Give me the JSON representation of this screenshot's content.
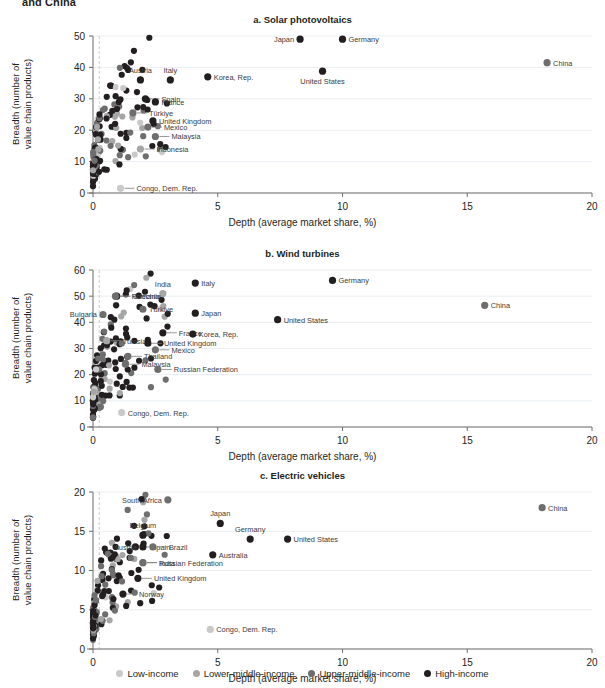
{
  "figure": {
    "cut_off_heading": "and China",
    "xlabel": "Depth (average market share, %)",
    "ylabel_line1": "Breadth (number of",
    "ylabel_line2": "value chain products)"
  },
  "legend": {
    "position": "bottom-center",
    "items": [
      {
        "label": "Low-income",
        "color": "#c9c9c9"
      },
      {
        "label": "Lower-middle-income",
        "color": "#a6a6a6"
      },
      {
        "label": "Upper-middle-income",
        "color": "#6e6e6e"
      },
      {
        "label": "High-income",
        "color": "#231f20"
      }
    ]
  },
  "chart_data": [
    {
      "type": "scatter",
      "id": "a",
      "title": "a. Solar photovoltaics",
      "xlabel": "Depth (average market share, %)",
      "ylabel": "Breadth (number of value chain products)",
      "xlim": [
        0,
        20
      ],
      "ylim": [
        0,
        50
      ],
      "xticks": [
        0,
        5,
        10,
        15,
        20
      ],
      "yticks": [
        0,
        10,
        20,
        30,
        40,
        50
      ],
      "grid": "horizontal-faint",
      "labeled_points": [
        {
          "name": "Japan",
          "x": 8.3,
          "y": 49,
          "group": "High-income",
          "label_pos": "left"
        },
        {
          "name": "Germany",
          "x": 10.0,
          "y": 49,
          "group": "High-income",
          "label_pos": "right"
        },
        {
          "name": "China",
          "x": 18.2,
          "y": 41.5,
          "group": "Upper-middle-income",
          "label_pos": "right"
        },
        {
          "name": "United States",
          "x": 9.2,
          "y": 38.8,
          "group": "High-income",
          "label_pos": "below"
        },
        {
          "name": "Korea, Rep.",
          "x": 4.6,
          "y": 37,
          "group": "High-income",
          "label_pos": "right"
        },
        {
          "name": "Austria",
          "x": 1.9,
          "y": 36,
          "group": "High-income",
          "label_pos": "above"
        },
        {
          "name": "Italy",
          "x": 3.1,
          "y": 36,
          "group": "High-income",
          "label_pos": "above"
        },
        {
          "name": "Spain",
          "x": 2.1,
          "y": 30,
          "group": "High-income",
          "label_pos": "leader"
        },
        {
          "name": "France",
          "x": 2.5,
          "y": 29,
          "group": "High-income",
          "label_pos": "right"
        },
        {
          "name": "Türkiye",
          "x": 1.6,
          "y": 25.5,
          "group": "Upper-middle-income",
          "label_pos": "leader"
        },
        {
          "name": "United Kingdom",
          "x": 2.4,
          "y": 23,
          "group": "High-income",
          "label_pos": "right"
        },
        {
          "name": "Mexico",
          "x": 2.2,
          "y": 21,
          "group": "Upper-middle-income",
          "label_pos": "leader"
        },
        {
          "name": "Malaysia",
          "x": 2.5,
          "y": 18,
          "group": "Upper-middle-income",
          "label_pos": "leader"
        },
        {
          "name": "Indonesia",
          "x": 1.9,
          "y": 14,
          "group": "Lower-middle-income",
          "label_pos": "leader"
        },
        {
          "name": "Congo, Dem. Rep.",
          "x": 1.1,
          "y": 1.5,
          "group": "Low-income",
          "label_pos": "leader"
        }
      ]
    },
    {
      "type": "scatter",
      "id": "b",
      "title": "b. Wind turbines",
      "xlabel": "Depth (average market share, %)",
      "ylabel": "Breadth (number of value chain products)",
      "xlim": [
        0,
        20
      ],
      "ylim": [
        0,
        60
      ],
      "xticks": [
        0,
        5,
        10,
        15,
        20
      ],
      "yticks": [
        0,
        10,
        20,
        30,
        40,
        50,
        60
      ],
      "grid": "horizontal-faint",
      "labeled_points": [
        {
          "name": "Germany",
          "x": 9.6,
          "y": 56,
          "group": "High-income",
          "label_pos": "right"
        },
        {
          "name": "Italy",
          "x": 4.1,
          "y": 55,
          "group": "High-income",
          "label_pos": "right"
        },
        {
          "name": "India",
          "x": 2.8,
          "y": 51,
          "group": "Lower-middle-income",
          "label_pos": "above"
        },
        {
          "name": "Czechia",
          "x": 0.95,
          "y": 50,
          "group": "High-income",
          "label_pos": "leader"
        },
        {
          "name": "China",
          "x": 15.7,
          "y": 46.5,
          "group": "Upper-middle-income",
          "label_pos": "right"
        },
        {
          "name": "Türkiye",
          "x": 2.0,
          "y": 45,
          "group": "Upper-middle-income",
          "label_pos": "right"
        },
        {
          "name": "Japan",
          "x": 4.1,
          "y": 43.5,
          "group": "High-income",
          "label_pos": "right"
        },
        {
          "name": "Bulgaria",
          "x": 0.4,
          "y": 43,
          "group": "Upper-middle-income",
          "label_pos": "left"
        },
        {
          "name": "Romania",
          "x": 0.9,
          "y": 50,
          "group": "Upper-middle-income",
          "label_pos": "leader"
        },
        {
          "name": "United States",
          "x": 7.4,
          "y": 41,
          "group": "High-income",
          "label_pos": "right"
        },
        {
          "name": "France",
          "x": 2.8,
          "y": 36,
          "group": "High-income",
          "label_pos": "leader"
        },
        {
          "name": "Korea, Rep.",
          "x": 4.0,
          "y": 35.5,
          "group": "High-income",
          "label_pos": "right"
        },
        {
          "name": "Tunisia",
          "x": 0.55,
          "y": 33,
          "group": "Lower-middle-income",
          "label_pos": "leader"
        },
        {
          "name": "United Kingdom",
          "x": 2.2,
          "y": 32,
          "group": "High-income",
          "label_pos": "leader"
        },
        {
          "name": "Mexico",
          "x": 2.5,
          "y": 29.5,
          "group": "Upper-middle-income",
          "label_pos": "leader"
        },
        {
          "name": "Thailand",
          "x": 1.4,
          "y": 27,
          "group": "Upper-middle-income",
          "label_pos": "leader"
        },
        {
          "name": "Malaysia",
          "x": 1.3,
          "y": 24,
          "group": "Upper-middle-income",
          "label_pos": "leader"
        },
        {
          "name": "Russian Federation",
          "x": 2.6,
          "y": 22,
          "group": "Upper-middle-income",
          "label_pos": "leader"
        },
        {
          "name": "Congo, Dem. Rep.",
          "x": 1.15,
          "y": 5.5,
          "group": "Low-income",
          "label_pos": "right"
        }
      ]
    },
    {
      "type": "scatter",
      "id": "c",
      "title": "c. Electric vehicles",
      "xlabel": "Depth (average market share, %)",
      "ylabel": "Breadth (number of value chain products)",
      "xlim": [
        0,
        20
      ],
      "ylim": [
        0,
        20
      ],
      "xticks": [
        0,
        5,
        10,
        15,
        20
      ],
      "yticks": [
        0,
        5,
        10,
        15,
        20
      ],
      "grid": "horizontal-faint",
      "labeled_points": [
        {
          "name": "South Africa",
          "x": 3.0,
          "y": 19,
          "group": "Upper-middle-income",
          "label_pos": "left"
        },
        {
          "name": "China",
          "x": 18.0,
          "y": 18,
          "group": "Upper-middle-income",
          "label_pos": "right"
        },
        {
          "name": "Japan",
          "x": 5.1,
          "y": 16,
          "group": "High-income",
          "label_pos": "above"
        },
        {
          "name": "Belgium",
          "x": 2.0,
          "y": 14.5,
          "group": "High-income",
          "label_pos": "above"
        },
        {
          "name": "Germany",
          "x": 6.3,
          "y": 14,
          "group": "High-income",
          "label_pos": "above"
        },
        {
          "name": "United States",
          "x": 7.8,
          "y": 14,
          "group": "High-income",
          "label_pos": "right"
        },
        {
          "name": "Spain",
          "x": 1.7,
          "y": 13,
          "group": "High-income",
          "label_pos": "leader"
        },
        {
          "name": "Brazil",
          "x": 2.4,
          "y": 13,
          "group": "Upper-middle-income",
          "label_pos": "leader"
        },
        {
          "name": "Austria",
          "x": 2.0,
          "y": 13,
          "group": "High-income",
          "label_pos": "left"
        },
        {
          "name": "Australia",
          "x": 4.8,
          "y": 12,
          "group": "High-income",
          "label_pos": "right"
        },
        {
          "name": "India",
          "x": 2.0,
          "y": 11,
          "group": "Lower-middle-income",
          "label_pos": "leader"
        },
        {
          "name": "United Kingdom",
          "x": 1.8,
          "y": 9,
          "group": "High-income",
          "label_pos": "leader"
        },
        {
          "name": "Norway",
          "x": 1.2,
          "y": 7,
          "group": "High-income",
          "label_pos": "leader"
        },
        {
          "name": "Russian Federation",
          "x": 2.0,
          "y": 11,
          "group": "Upper-middle-income",
          "label_pos": "leader"
        },
        {
          "name": "Congo, Dem. Rep.",
          "x": 4.7,
          "y": 2.5,
          "group": "Low-income",
          "label_pos": "right"
        }
      ]
    }
  ]
}
